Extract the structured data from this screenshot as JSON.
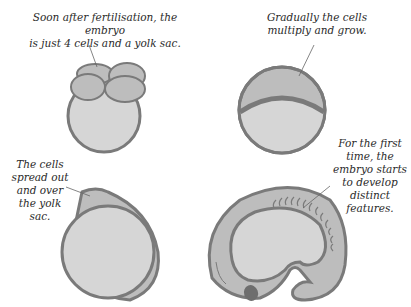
{
  "colors": {
    "outline": "#7a7a7a",
    "cell_fill": "#bdbdbd",
    "yolk_fill": "#d6d6d6",
    "text": "#2a2a2a",
    "leader_line": "#666666"
  },
  "stages": [
    {
      "id": "stage-1",
      "caption": "Soon after fertilisation, the embryo\nis just 4 cells and a yolk sac."
    },
    {
      "id": "stage-2",
      "caption": "Gradually the cells\nmultiply and grow."
    },
    {
      "id": "stage-3",
      "caption": "The cells\nspread out\nand over\nthe yolk\nsac."
    },
    {
      "id": "stage-4",
      "caption": "For the first\ntime, the\nembryo starts\nto develop\ndistinct\nfeatures."
    }
  ]
}
